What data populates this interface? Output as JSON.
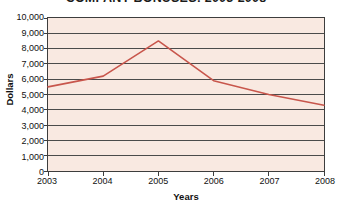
{
  "chart_data": {
    "type": "line",
    "title": "COMPANY BONUSES: 2003-2008",
    "xlabel": "Years",
    "ylabel": "Dollars",
    "x": [
      2003,
      2004,
      2005,
      2006,
      2007,
      2008
    ],
    "xtick_labels": [
      "2003",
      "2004",
      "2005",
      "2006",
      "2007",
      "2008"
    ],
    "values": [
      5500,
      6200,
      8500,
      5900,
      5000,
      4300
    ],
    "series": [
      {
        "name": "Bonuses",
        "values": [
          5500,
          6200,
          8500,
          5900,
          5000,
          4300
        ]
      }
    ],
    "ylim": [
      0,
      10000
    ],
    "ytick_values": [
      0,
      1000,
      2000,
      3000,
      4000,
      5000,
      6000,
      7000,
      8000,
      9000,
      10000
    ],
    "ytick_labels": [
      "0",
      "1,000",
      "2,000",
      "3,000",
      "4,000",
      "5,000",
      "6,000",
      "7,000",
      "8,000",
      "9,000",
      "10,000"
    ],
    "xlim": [
      2003,
      2008
    ],
    "grid": true,
    "grid_axis": "y",
    "legend": false,
    "markers": false,
    "colors": {
      "line": "#c8564c",
      "plot_background": "#f9e9e1",
      "gridline": "#494949",
      "axis_border": "#3d3d3d",
      "text": "#111111",
      "page_background": "#ffffff"
    }
  }
}
